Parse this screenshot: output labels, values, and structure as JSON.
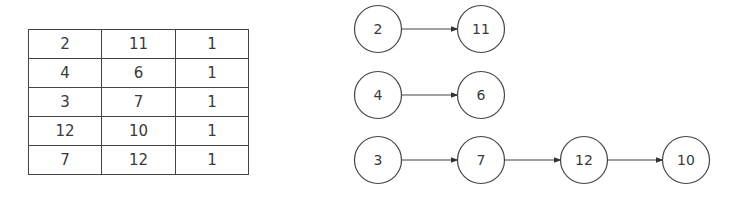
{
  "table": {
    "rows": [
      [
        "2",
        "11",
        "1"
      ],
      [
        "4",
        "6",
        "1"
      ],
      [
        "3",
        "7",
        "1"
      ],
      [
        "12",
        "10",
        "1"
      ],
      [
        "7",
        "12",
        "1"
      ]
    ]
  },
  "graph": {
    "chains": [
      [
        "2",
        "11"
      ],
      [
        "4",
        "6"
      ],
      [
        "3",
        "7",
        "12",
        "10"
      ]
    ],
    "nodes": [
      {
        "label": "2",
        "cx": 378,
        "cy": 29
      },
      {
        "label": "11",
        "cx": 481,
        "cy": 29
      },
      {
        "label": "4",
        "cx": 378,
        "cy": 95
      },
      {
        "label": "6",
        "cx": 481,
        "cy": 95
      },
      {
        "label": "3",
        "cx": 378,
        "cy": 160
      },
      {
        "label": "7",
        "cx": 481,
        "cy": 160
      },
      {
        "label": "12",
        "cx": 584,
        "cy": 160
      },
      {
        "label": "10",
        "cx": 686,
        "cy": 160
      }
    ],
    "edges": [
      {
        "from": "2",
        "to": "11"
      },
      {
        "from": "4",
        "to": "6"
      },
      {
        "from": "3",
        "to": "7"
      },
      {
        "from": "7",
        "to": "12"
      },
      {
        "from": "12",
        "to": "10"
      }
    ]
  }
}
